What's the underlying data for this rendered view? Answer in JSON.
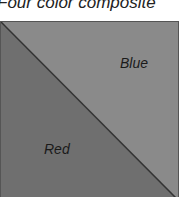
{
  "title": "Four color composite",
  "regions": [
    {
      "name": "Blue",
      "label": "Blue",
      "color": "#8a8a8a",
      "position": "upper-right triangle"
    },
    {
      "name": "Red",
      "label": "Red",
      "color": "#6f6f6f",
      "position": "lower-left triangle"
    }
  ],
  "colors": {
    "light": "#8a8a8a",
    "dark": "#6f6f6f",
    "border": "#3a3a3a"
  }
}
